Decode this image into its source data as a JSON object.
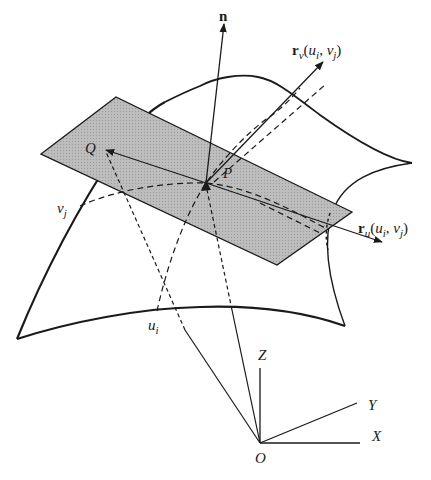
{
  "diagram": {
    "type": "parametric-surface-tangent-plane",
    "colors": {
      "ink": "#1a1a1a",
      "plane_fill": "#b8b8b8",
      "background": "#ffffff"
    },
    "labels": {
      "normal": "n",
      "rv_main": "r",
      "rv_sub": "v",
      "rv_args_open": "(",
      "rv_u": "u",
      "rv_u_sub": "i",
      "rv_comma": ", ",
      "rv_v": "v",
      "rv_v_sub": "j",
      "rv_close": ")",
      "ru_main": "r",
      "ru_sub": "u",
      "ru_args_open": "(",
      "ru_u": "u",
      "ru_u_sub": "i",
      "ru_comma": ", ",
      "ru_v": "v",
      "ru_v_sub": "j",
      "ru_close": ")",
      "point_Q": "Q",
      "point_P": "P",
      "vj_main": "v",
      "vj_sub": "j",
      "ui_main": "u",
      "ui_sub": "i",
      "axis_Z": "Z",
      "axis_Y": "Y",
      "axis_X": "X",
      "origin": "O"
    }
  }
}
